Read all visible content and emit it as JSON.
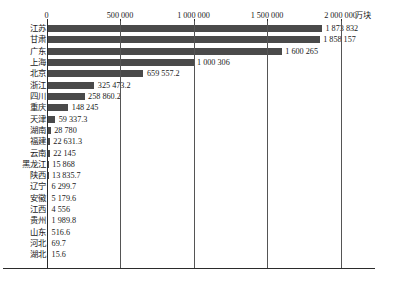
{
  "chart_data": {
    "type": "bar",
    "orientation": "horizontal",
    "title": "",
    "xlabel": "",
    "ylabel": "",
    "unit": "万块",
    "xlim": [
      0,
      2000000
    ],
    "xticks": [
      0,
      500000,
      1000000,
      1500000,
      2000000
    ],
    "xtick_labels": [
      "0",
      "500 000",
      "1 000 000",
      "1 500 000",
      "2 000 000"
    ],
    "grid": true,
    "legend": false,
    "bar_color": "#4a4a4a",
    "categories": [
      "江苏",
      "甘肃",
      "广东",
      "上海",
      "北京",
      "浙江",
      "四川",
      "重庆",
      "天津",
      "湖南",
      "福建",
      "云南",
      "黑龙江",
      "陕西",
      "辽宁",
      "安徽",
      "江西",
      "贵州",
      "山东",
      "河北",
      "湖北"
    ],
    "values": [
      1873832,
      1858157,
      1600265,
      1000306,
      659557.2,
      325473.2,
      258860.2,
      148245,
      59337.3,
      28780,
      22631.3,
      22145,
      15868,
      13835.7,
      6299.7,
      5179.6,
      4556,
      1989.8,
      516.6,
      69.7,
      15.6
    ],
    "value_labels": [
      "1 873 832",
      "1 858 157",
      "1 600 265",
      "1 000 306",
      "659 557.2",
      "325 473.2",
      "258 860.2",
      "148 245",
      "59 337.3",
      "28 780",
      "22 631.3",
      "22 145",
      "15 868",
      "13 835.7",
      "6 299.7",
      "5 179.6",
      "4 556",
      "1 989.8",
      "516.6",
      "69.7",
      "15.6"
    ]
  }
}
